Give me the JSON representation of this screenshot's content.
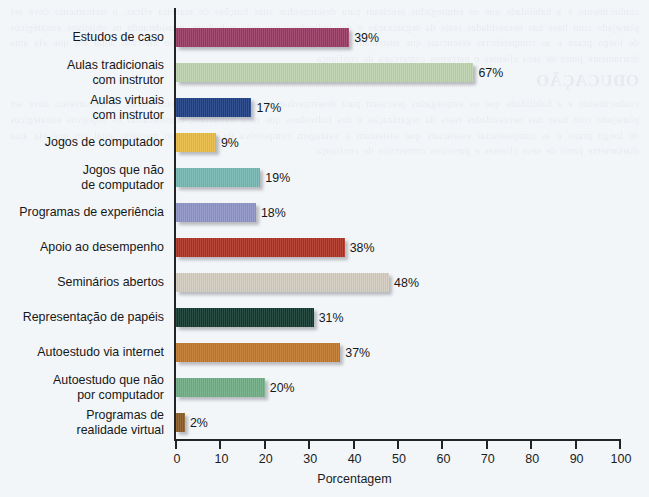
{
  "chart_data": {
    "type": "bar",
    "orientation": "horizontal",
    "title": "",
    "xlabel": "Porcentagem",
    "ylabel": "",
    "xlim": [
      0,
      100
    ],
    "xticks": [
      0,
      10,
      20,
      30,
      40,
      50,
      60,
      70,
      80,
      90,
      100
    ],
    "grid": false,
    "legend": "none",
    "value_suffix": "%",
    "categories": [
      "Estudos de caso",
      "Aulas tradicionais\ncom instrutor",
      "Aulas virtuais\ncom instrutor",
      "Jogos de computador",
      "Jogos que não\nde computador",
      "Programas de experiência",
      "Apoio ao desempenho",
      "Seminários abertos",
      "Representação de papéis",
      "Autoestudo via internet",
      "Autoestudo que não\npor computador",
      "Programas de\nrealidade virtual"
    ],
    "values": [
      39,
      67,
      17,
      9,
      19,
      18,
      38,
      48,
      31,
      37,
      20,
      2
    ],
    "value_labels": [
      "39%",
      "67%",
      "17%",
      "9%",
      "19%",
      "18%",
      "38%",
      "48%",
      "31%",
      "37%",
      "20%",
      "2%"
    ],
    "colors": [
      "#9b3a63",
      "#bcd2ae",
      "#1d3f86",
      "#e9ba41",
      "#74b7b2",
      "#8d93c6",
      "#b03222",
      "#d2ccbe",
      "#123a2e",
      "#c2772a",
      "#6eae85",
      "#8c5b23"
    ]
  },
  "bleed_text": {
    "heading": "ODUCAÇÃO",
    "body": "conhecimento e a habilidade que os empregados precisam para desempenhar suas funções de maneira eficaz, o treinamento deve ser planejado com base nas necessidades reais da organização e dos indivíduos que nela trabalham, considerando os objetivos estratégicos de longo prazo e as competências essenciais que sustentam a vantagem competitiva da empresa no mercado atual em que ela atua diariamente junto de seus clientes e parceiros comerciais de confiança"
  }
}
